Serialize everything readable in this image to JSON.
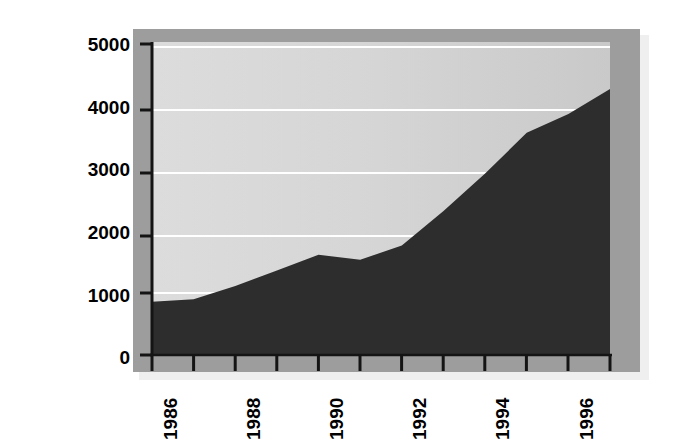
{
  "chart_data": {
    "type": "area",
    "title": "",
    "subtitle": "",
    "xlabel": "",
    "ylabel": "Millions of Dollars",
    "x": [
      1986,
      1987,
      1988,
      1989,
      1990,
      1991,
      1992,
      1993,
      1994,
      1995,
      1996,
      1997
    ],
    "values": [
      850,
      890,
      1100,
      1350,
      1600,
      1520,
      1750,
      2300,
      2900,
      3550,
      3850,
      4250
    ],
    "series": [
      {
        "name": "Millions of Dollars",
        "values": [
          850,
          890,
          1100,
          1350,
          1600,
          1520,
          1750,
          2300,
          2900,
          3550,
          3850,
          4250
        ]
      }
    ],
    "ylim": [
      0,
      5000
    ],
    "xlim": [
      1986,
      1997
    ],
    "y_ticks": [
      0,
      1000,
      2000,
      3000,
      4000,
      5000
    ],
    "y_tick_labels": [
      "0",
      "1000",
      "2000",
      "3000",
      "4000",
      "5000"
    ],
    "x_ticks": [
      1986,
      1987,
      1988,
      1989,
      1990,
      1991,
      1992,
      1993,
      1994,
      1995,
      1996,
      1997
    ],
    "x_tick_labels": [
      "1986",
      "",
      "1988",
      "",
      "1990",
      "",
      "1992",
      "",
      "1994",
      "",
      "1996",
      ""
    ],
    "x_labeled_years": [
      "1986",
      "1988",
      "1990",
      "1992",
      "1994",
      "1996"
    ],
    "grid": true,
    "grid_color": "#ffffff",
    "legend": "none",
    "area_color": "#2d2d2d",
    "plot_background": "#d2d2d2",
    "plot_border_color": "#9a9a9a",
    "axis_color": "#1a1a1a",
    "figure_background": "#ffffff"
  },
  "axis": {
    "y_title": "Millions of Dollars"
  }
}
